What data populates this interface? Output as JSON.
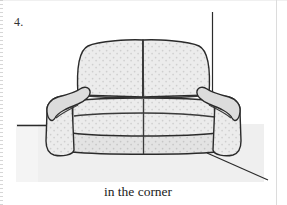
{
  "page": {
    "item_number": "4.",
    "caption": "in the corner",
    "background_color": "#ffffff"
  },
  "illustration": {
    "name": "sofa-in-corner-line-drawing",
    "subject": "sofa",
    "scene": "room corner",
    "colors": {
      "outline": "#2b2b2b",
      "seam": "#3a3a3a",
      "upholstery_fill": "#ececec",
      "upholstery_shade": "#e2e2e2",
      "upholstery_dot": "#cfcfcf",
      "arm_top_shade": "#dcdcdc",
      "wall_fill": "#ffffff",
      "floor_fill": "#efefef",
      "corner_line": "#2b2b2b"
    },
    "parts": [
      {
        "name": "wall-corner-vertical-line",
        "label": "corner wall line"
      },
      {
        "name": "baseboard-left-line",
        "label": "left wall baseline"
      },
      {
        "name": "floor-diagonal-line",
        "label": "right floor line"
      },
      {
        "name": "back-cushion-left",
        "label": "left back cushion"
      },
      {
        "name": "back-cushion-right",
        "label": "right back cushion"
      },
      {
        "name": "seat-cushion-left",
        "label": "left seat cushion"
      },
      {
        "name": "seat-cushion-right",
        "label": "right seat cushion"
      },
      {
        "name": "arm-left",
        "label": "left arm"
      },
      {
        "name": "arm-right",
        "label": "right arm"
      },
      {
        "name": "base-skirt",
        "label": "sofa base"
      }
    ]
  }
}
